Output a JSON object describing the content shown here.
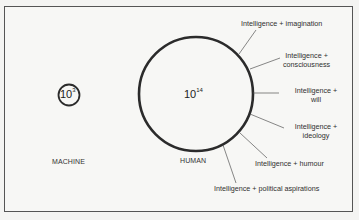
{
  "diagram": {
    "machine": {
      "label": "MACHINE",
      "value_base": "10",
      "value_exp": "3",
      "circle": {
        "cx": 69,
        "cy": 95,
        "r": 11
      }
    },
    "human": {
      "label": "HUMAN",
      "value_base": "10",
      "value_exp": "14",
      "circle": {
        "cx": 196,
        "cy": 94,
        "r": 57
      }
    },
    "annotations": [
      {
        "line1": "Intelligence + imagination",
        "line2": ""
      },
      {
        "line1": "Intelligence +",
        "line2": "consciousness"
      },
      {
        "line1": "Intelligence +",
        "line2": "will"
      },
      {
        "line1": "Intelligence +",
        "line2": "ideology"
      },
      {
        "line1": "Intelligence + humour",
        "line2": ""
      },
      {
        "line1": "Intelligence + political aspirations",
        "line2": ""
      }
    ],
    "colors": {
      "stroke": "#2b2b2b",
      "leader": "#555555",
      "frame": "#555555"
    }
  }
}
